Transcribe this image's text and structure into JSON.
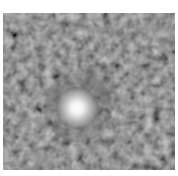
{
  "image": {
    "description": "Grayscale astronomical image showing a bright compact source with a fainter adjacent glow against a noisy dark background",
    "colors": {
      "background": "#222222",
      "core": "#ffffff",
      "border": "#ffffff"
    }
  }
}
